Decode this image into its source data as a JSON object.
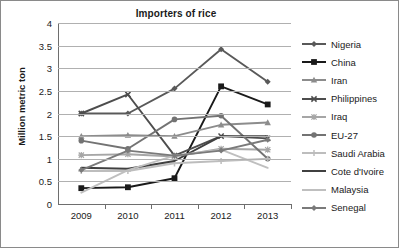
{
  "chart_data": {
    "type": "line",
    "title": "Importers of rice",
    "xlabel": "",
    "ylabel": "Million metric ton",
    "categories": [
      "2009",
      "2010",
      "2011",
      "2012",
      "2013"
    ],
    "ylim": [
      0,
      4
    ],
    "yticks": [
      "0",
      "0.5",
      "1",
      "1.5",
      "2",
      "2.5",
      "3",
      "3.5",
      "4"
    ],
    "grid": true,
    "legend_position": "right",
    "series": [
      {
        "name": "Nigeria",
        "values": [
          2.0,
          2.0,
          2.55,
          3.42,
          2.7
        ],
        "color": "#595959",
        "marker": "diamond"
      },
      {
        "name": "China",
        "values": [
          0.35,
          0.37,
          0.57,
          2.6,
          2.2
        ],
        "color": "#1a1a1a",
        "marker": "square"
      },
      {
        "name": "Iran",
        "values": [
          1.5,
          1.52,
          1.5,
          1.75,
          1.8
        ],
        "color": "#8c8c8c",
        "marker": "triangle"
      },
      {
        "name": "Philippines",
        "values": [
          2.0,
          2.42,
          1.07,
          1.5,
          1.45
        ],
        "color": "#4d4d4d",
        "marker": "cross"
      },
      {
        "name": "Iraq",
        "values": [
          1.08,
          1.1,
          1.05,
          1.22,
          1.2
        ],
        "color": "#a6a6a6",
        "marker": "asterisk"
      },
      {
        "name": "EU-27",
        "values": [
          1.4,
          1.22,
          1.87,
          1.95,
          1.0
        ],
        "color": "#737373",
        "marker": "circle"
      },
      {
        "name": "Saudi Arabia",
        "values": [
          0.73,
          0.73,
          0.9,
          0.95,
          1.0
        ],
        "color": "#bdbdbd",
        "marker": "plus"
      },
      {
        "name": "Cote d'Ivoire",
        "values": [
          0.8,
          0.78,
          0.95,
          1.5,
          1.5
        ],
        "color": "#404040",
        "marker": "none"
      },
      {
        "name": "Malaysia",
        "values": [
          0.25,
          0.75,
          1.07,
          1.2,
          0.8
        ],
        "color": "#bfbfbf",
        "marker": "none"
      },
      {
        "name": "Senegal",
        "values": [
          0.75,
          1.18,
          1.07,
          1.18,
          1.42
        ],
        "color": "#7a7a7a",
        "marker": "diamond"
      }
    ]
  }
}
